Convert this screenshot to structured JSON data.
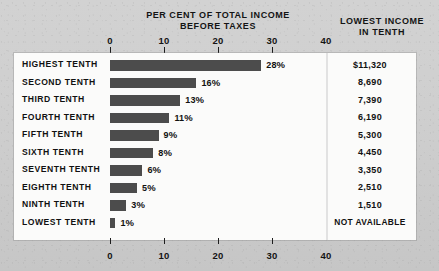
{
  "chart_data": {
    "type": "bar",
    "title": "PER CENT OF TOTAL INCOME BEFORE TAXES",
    "title_line1": "PER CENT OF TOTAL INCOME",
    "title_line2": "BEFORE TAXES",
    "orientation": "horizontal",
    "xlabel": "",
    "ylabel": "",
    "xlim": [
      0,
      40
    ],
    "xticks": [
      0,
      10,
      20,
      30,
      40
    ],
    "xtick_labels": [
      "0",
      "10",
      "20",
      "30",
      "40"
    ],
    "grid": false,
    "legend": false,
    "bar_color": "#4c4c4c",
    "categories": [
      "HIGHEST TENTH",
      "SECOND TENTH",
      "THIRD TENTH",
      "FOURTH TENTH",
      "FIFTH TENTH",
      "SIXTH TENTH",
      "SEVENTH TENTH",
      "EIGHTH TENTH",
      "NINTH TENTH",
      "LOWEST TENTH"
    ],
    "values": [
      28,
      16,
      13,
      11,
      9,
      8,
      6,
      5,
      3,
      1
    ],
    "data_labels": [
      "28%",
      "16%",
      "13%",
      "11%",
      "9%",
      "8%",
      "6%",
      "5%",
      "3%",
      "1%"
    ],
    "side_column": {
      "title_line1": "LOWEST INCOME",
      "title_line2": "IN TENTH",
      "values": [
        "$11,320",
        "8,690",
        "7,390",
        "6,190",
        "5,300",
        "4,450",
        "3,350",
        "2,510",
        "1,510",
        "NOT AVAILABLE"
      ]
    }
  },
  "colors": {
    "background": "#cccccc",
    "panel": "#fbfbfa",
    "bar": "#4c4c4c",
    "text": "#111111"
  }
}
